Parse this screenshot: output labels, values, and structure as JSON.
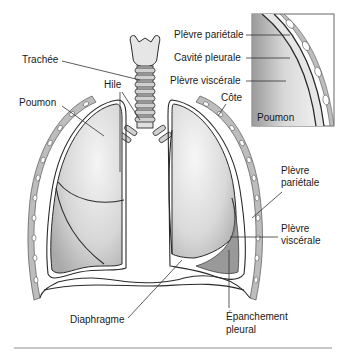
{
  "figure": {
    "labels": {
      "trachea": "Trachée",
      "hilum": "Hile",
      "lung": "Poumon",
      "rib": "Côte",
      "parietal_pleura": "Plèvre",
      "parietal_pleura_2": "pariétale",
      "visceral_pleura": "Plèvre",
      "visceral_pleura_2": "viscérale",
      "diaphragm": "Diaphragme",
      "effusion": "Épanchement",
      "effusion_2": "pleural"
    },
    "inset": {
      "labels": {
        "parietal_pleura": "Plèvre pariétale",
        "pleural_cavity": "Cavité pleurale",
        "visceral_pleura": "Plèvre viscérale",
        "lung": "Poumon"
      }
    },
    "colors": {
      "lung_light": "#f2f2f2",
      "lung_dark": "#b8b8b8",
      "rib": "#bdbdbd",
      "effusion": "#8f8f8f",
      "outline": "#2a2a2a",
      "divider": "#c8c8c8"
    }
  }
}
